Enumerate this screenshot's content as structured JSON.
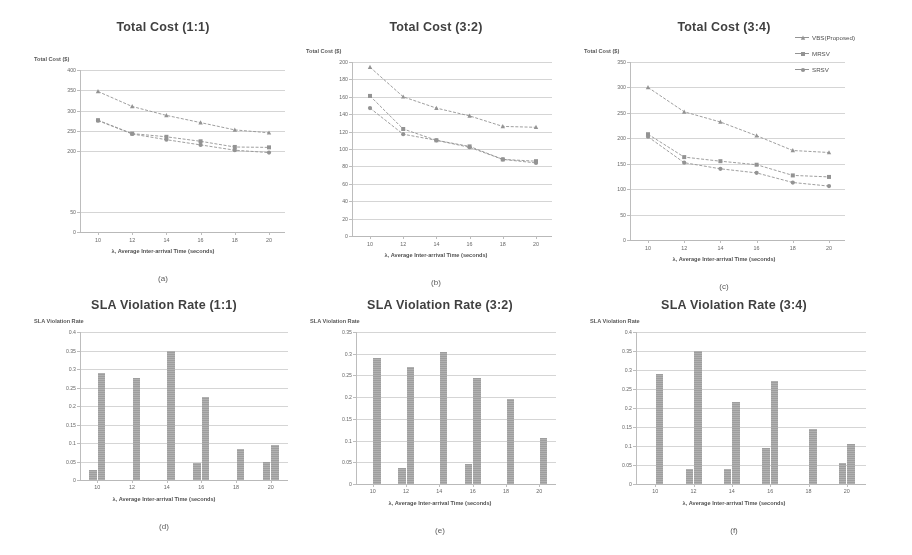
{
  "figure": {
    "background": "#ffffff",
    "line_color": "#8d8d8d",
    "bar_color": "#9a9a9a",
    "grid_color": "#d9d9d9",
    "captions": [
      "(a)",
      "(b)",
      "(c)",
      "(d)",
      "(e)",
      "(f)"
    ]
  },
  "legend": {
    "position": "top-right of panel (c)",
    "entries": [
      {
        "label": "VBS(Proposed)",
        "marker": "triangle"
      },
      {
        "label": "MRSV",
        "marker": "square"
      },
      {
        "label": "SRSV",
        "marker": "circle"
      }
    ]
  },
  "chart_data": [
    {
      "id": "a",
      "type": "line",
      "title": "Total Cost (1:1)",
      "caption": "(a)",
      "xlabel": "λ, Average Inter-arrival Time (seconds)",
      "ylabel": "Total Cost ($)",
      "x": [
        10,
        12,
        14,
        16,
        18,
        20
      ],
      "xticklabels": [
        "10",
        "12",
        "14",
        "16",
        "18",
        "20"
      ],
      "yticklabels": [
        "400",
        "350",
        "300",
        "250",
        "200",
        "50",
        "0"
      ],
      "ytickvalues": [
        400,
        350,
        300,
        250,
        200,
        50,
        0
      ],
      "ylim": [
        0,
        400
      ],
      "grid": true,
      "series": [
        {
          "name": "SRSV",
          "marker": "triangle",
          "values": [
            347,
            310,
            288,
            270,
            252,
            245
          ]
        },
        {
          "name": "MRSV",
          "marker": "square",
          "values": [
            276,
            243,
            235,
            224,
            210,
            209
          ]
        },
        {
          "name": "VBS(Proposed)",
          "marker": "circle",
          "values": [
            275,
            242,
            228,
            215,
            202,
            196
          ]
        }
      ]
    },
    {
      "id": "b",
      "type": "line",
      "title": "Total Cost (3:2)",
      "caption": "(b)",
      "xlabel": "λ, Average Inter-arrival Time (seconds)",
      "ylabel": "Total Cost ($)",
      "x": [
        10,
        12,
        14,
        16,
        18,
        20
      ],
      "xticklabels": [
        "10",
        "12",
        "14",
        "16",
        "18",
        "20"
      ],
      "yticklabels": [
        "200",
        "180",
        "160",
        "140",
        "120",
        "100",
        "80",
        "60",
        "40",
        "20",
        "0"
      ],
      "ytickvalues": [
        200,
        180,
        160,
        140,
        120,
        100,
        80,
        60,
        40,
        20,
        0
      ],
      "ylim": [
        0,
        200
      ],
      "grid": true,
      "series": [
        {
          "name": "SRSV",
          "marker": "triangle",
          "values": [
            194,
            160,
            147,
            138,
            126,
            125
          ]
        },
        {
          "name": "MRSV",
          "marker": "square",
          "values": [
            161,
            123,
            110,
            103,
            88,
            86
          ]
        },
        {
          "name": "VBS(Proposed)",
          "marker": "circle",
          "values": [
            147,
            117,
            110,
            102,
            88,
            84
          ]
        }
      ]
    },
    {
      "id": "c",
      "type": "line",
      "title": "Total Cost (3:4)",
      "caption": "(c)",
      "xlabel": "λ, Average Inter-arrival Time (seconds)",
      "ylabel": "Total Cost ($)",
      "x": [
        10,
        12,
        14,
        16,
        18,
        20
      ],
      "xticklabels": [
        "10",
        "12",
        "14",
        "16",
        "18",
        "20"
      ],
      "yticklabels": [
        "350",
        "300",
        "250",
        "200",
        "150",
        "100",
        "50",
        "0"
      ],
      "ytickvalues": [
        350,
        300,
        250,
        200,
        150,
        100,
        50,
        0
      ],
      "ylim": [
        0,
        350
      ],
      "grid": true,
      "series": [
        {
          "name": "SRSV",
          "marker": "triangle",
          "values": [
            300,
            252,
            232,
            205,
            176,
            172
          ]
        },
        {
          "name": "MRSV",
          "marker": "square",
          "values": [
            208,
            163,
            155,
            148,
            127,
            124
          ]
        },
        {
          "name": "VBS(Proposed)",
          "marker": "circle",
          "values": [
            203,
            152,
            140,
            132,
            113,
            106
          ]
        }
      ]
    },
    {
      "id": "d",
      "type": "bar",
      "title": "SLA Violation Rate (1:1)",
      "caption": "(d)",
      "xlabel": "λ, Average Inter-arrival Time (seconds)",
      "ylabel": "SLA Violation Rate",
      "categories": [
        "10",
        "12",
        "14",
        "16",
        "18",
        "20"
      ],
      "yticklabels": [
        "0.4",
        "0.35",
        "0.3",
        "0.25",
        "0.2",
        "0.15",
        "0.1",
        "0.05",
        "0"
      ],
      "ytickvalues": [
        0.4,
        0.35,
        0.3,
        0.25,
        0.2,
        0.15,
        0.1,
        0.05,
        0
      ],
      "ylim": [
        0,
        0.4
      ],
      "grid": true,
      "series": [
        {
          "name": "bar-left",
          "values": [
            0.027,
            0.0,
            0.0,
            0.045,
            0.0,
            0.05
          ]
        },
        {
          "name": "bar-right",
          "values": [
            0.29,
            0.275,
            0.35,
            0.225,
            0.085,
            0.095
          ]
        }
      ]
    },
    {
      "id": "e",
      "type": "bar",
      "title": "SLA Violation Rate (3:2)",
      "caption": "(e)",
      "xlabel": "λ, Average Inter-arrival Time (seconds)",
      "ylabel": "SLA Violation Rate",
      "categories": [
        "10",
        "12",
        "14",
        "16",
        "18",
        "20"
      ],
      "yticklabels": [
        "0.35",
        "0.3",
        "0.25",
        "0.2",
        "0.15",
        "0.1",
        "0.05",
        "0"
      ],
      "ytickvalues": [
        0.35,
        0.3,
        0.25,
        0.2,
        0.15,
        0.1,
        0.05,
        0
      ],
      "ylim": [
        0,
        0.35
      ],
      "grid": true,
      "series": [
        {
          "name": "bar-left",
          "values": [
            0.0,
            0.038,
            0.0,
            0.047,
            0.0,
            0.0
          ]
        },
        {
          "name": "bar-right",
          "values": [
            0.29,
            0.27,
            0.305,
            0.245,
            0.195,
            0.105
          ]
        }
      ]
    },
    {
      "id": "f",
      "type": "bar",
      "title": "SLA Violation Rate (3:4)",
      "caption": "(f)",
      "xlabel": "λ, Average Inter-arrival Time (seconds)",
      "ylabel": "SLA Violation Rate",
      "categories": [
        "10",
        "12",
        "14",
        "16",
        "18",
        "20"
      ],
      "yticklabels": [
        "0.4",
        "0.35",
        "0.3",
        "0.25",
        "0.2",
        "0.15",
        "0.1",
        "0.05",
        "0"
      ],
      "ytickvalues": [
        0.4,
        0.35,
        0.3,
        0.25,
        0.2,
        0.15,
        0.1,
        0.05,
        0
      ],
      "ylim": [
        0,
        0.4
      ],
      "grid": true,
      "series": [
        {
          "name": "bar-left",
          "values": [
            0.0,
            0.04,
            0.04,
            0.095,
            0.0,
            0.055
          ]
        },
        {
          "name": "bar-right",
          "values": [
            0.29,
            0.35,
            0.215,
            0.27,
            0.145,
            0.105
          ]
        }
      ]
    }
  ]
}
